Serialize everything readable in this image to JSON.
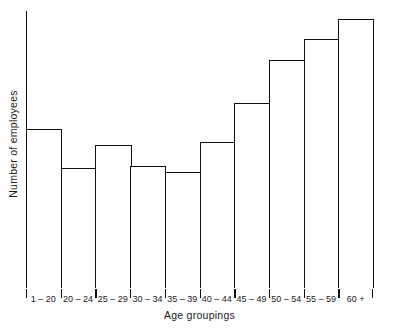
{
  "chart_data": {
    "type": "bar",
    "title": "",
    "xlabel": "Age groupings",
    "ylabel": "Number of employees",
    "grid": false,
    "legend": false,
    "y_tick_labels": [],
    "y_axis_labeled": false,
    "axis_style": "open-left-bottom",
    "bar_style": "outline-only",
    "bar_gap": 0,
    "categories": [
      "1 – 20",
      "20 – 24",
      "25 – 29",
      "30 – 34",
      "35 – 39",
      "40 – 44",
      "45 – 49",
      "50 – 54",
      "55 – 59",
      "60 +"
    ],
    "values": [
      0.574,
      0.433,
      0.516,
      0.44,
      0.419,
      0.527,
      0.668,
      0.823,
      0.899,
      0.971
    ],
    "value_units": "fraction-of-plot-height",
    "ylim": [
      0,
      1
    ],
    "colors": {
      "background": "#ffffff",
      "axis": "#111111",
      "bar_outline": "#111111",
      "bar_fill": "#ffffff",
      "text": "#1a1a1a"
    }
  }
}
